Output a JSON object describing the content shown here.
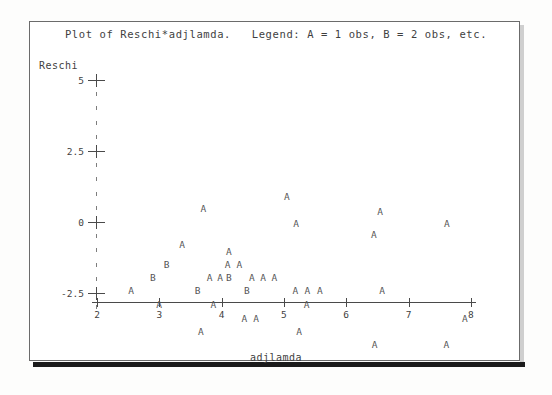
{
  "document": {
    "kind": "sas-plot-printout",
    "title": "Plot of Reschi*adjlamda.   Legend: A = 1 obs, B = 2 obs, etc."
  },
  "chart_data": {
    "type": "scatter",
    "title": "Plot of Reschi*adjlamda.   Legend: A = 1 obs, B = 2 obs, etc.",
    "xlabel": "adjlamda",
    "ylabel": "Reschi",
    "xlim": [
      2,
      8
    ],
    "ylim": [
      -2.5,
      5
    ],
    "grid": false,
    "legend": "A = 1 obs, B = 2 obs, etc.",
    "legend_position": "title",
    "xticks": [
      "2",
      "3",
      "4",
      "5",
      "6",
      "7",
      "8"
    ],
    "xtick_values": [
      2,
      3,
      4,
      5,
      6,
      7,
      8
    ],
    "yticks": [
      "5",
      "2.5",
      "0",
      "-2.5"
    ],
    "ytick_values": [
      5,
      2.5,
      0,
      -2.5
    ],
    "minor_ticks_per_interval": 4,
    "symbol_meaning": {
      "A": 1,
      "B": 2
    },
    "points": [
      {
        "label": "A",
        "x": 5.05,
        "y": 0.93
      },
      {
        "label": "A",
        "x": 6.55,
        "y": 0.4
      },
      {
        "label": "A",
        "x": 3.71,
        "y": 0.48
      },
      {
        "label": "A",
        "x": 5.2,
        "y": -0.03
      },
      {
        "label": "A",
        "x": 7.62,
        "y": -0.05
      },
      {
        "label": "A",
        "x": 6.45,
        "y": -0.43
      },
      {
        "label": "A",
        "x": 3.37,
        "y": -0.77
      },
      {
        "label": "A",
        "x": 4.12,
        "y": -1.02
      },
      {
        "label": "B",
        "x": 3.12,
        "y": -1.47
      },
      {
        "label": "A",
        "x": 4.1,
        "y": -1.48
      },
      {
        "label": "A",
        "x": 4.29,
        "y": -1.48
      },
      {
        "label": "B",
        "x": 2.9,
        "y": -1.93
      },
      {
        "label": "A",
        "x": 3.81,
        "y": -1.93
      },
      {
        "label": "A",
        "x": 3.98,
        "y": -1.93
      },
      {
        "label": "B",
        "x": 4.12,
        "y": -1.93
      },
      {
        "label": "A",
        "x": 4.49,
        "y": -1.93
      },
      {
        "label": "A",
        "x": 4.67,
        "y": -1.93
      },
      {
        "label": "A",
        "x": 4.85,
        "y": -1.93
      },
      {
        "label": "A",
        "x": 2.55,
        "y": -2.4
      },
      {
        "label": "B",
        "x": 3.62,
        "y": -2.4
      },
      {
        "label": "B",
        "x": 4.41,
        "y": -2.4
      },
      {
        "label": "A",
        "x": 5.19,
        "y": -2.4
      },
      {
        "label": "A",
        "x": 5.38,
        "y": -2.4
      },
      {
        "label": "A",
        "x": 5.58,
        "y": -2.4
      },
      {
        "label": "A",
        "x": 6.58,
        "y": -2.4
      },
      {
        "label": "A",
        "x": 3.0,
        "y": -2.9
      },
      {
        "label": "A",
        "x": 3.87,
        "y": -2.9
      },
      {
        "label": "A",
        "x": 5.37,
        "y": -2.9
      },
      {
        "label": "A",
        "x": 4.37,
        "y": -3.37
      },
      {
        "label": "A",
        "x": 4.56,
        "y": -3.37
      },
      {
        "label": "A",
        "x": 7.91,
        "y": -3.37
      },
      {
        "label": "A",
        "x": 3.67,
        "y": -3.85
      },
      {
        "label": "A",
        "x": 5.25,
        "y": -3.85
      },
      {
        "label": "A",
        "x": 6.46,
        "y": -4.31
      },
      {
        "label": "A",
        "x": 7.61,
        "y": -4.31
      }
    ]
  }
}
